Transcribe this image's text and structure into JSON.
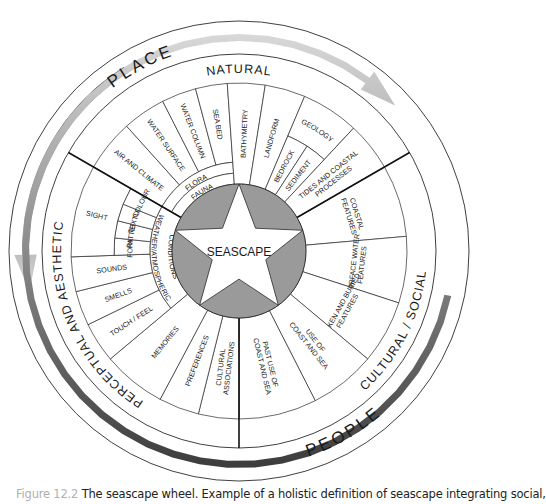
{
  "geometry": {
    "cx": 239,
    "cy": 251,
    "r_outer": 230,
    "r_ring": 197,
    "r_sector": 168,
    "r_mid": 125,
    "r_inner2": 89,
    "r_inner1": 78,
    "r_core": 67
  },
  "colors": {
    "line": "#2a2a2a",
    "core": "#9a9a9a",
    "star": "#ffffff",
    "arrow_dark": "#3c3c3c",
    "arrow_light": "#d4d4d4"
  },
  "center_label": "SEASCAPE",
  "outer_labels": {
    "place": "PLACE",
    "people": "PEOPLE",
    "natural": "NATURAL",
    "cultural_social": "CULTURAL / SOCIAL",
    "perceptual_aesthetic": "PERCEPTUAL AND AESTHETIC"
  },
  "sectors": {
    "natural": [
      {
        "label": [
          "AIR AND CLIMATE"
        ],
        "a0": 210,
        "a1": 228,
        "r0": 89,
        "r1": 168
      },
      {
        "label": [
          "WATER SURFACE"
        ],
        "a0": 228,
        "a1": 243,
        "r0": 89,
        "r1": 168
      },
      {
        "label": [
          "WATER COLUMN"
        ],
        "a0": 243,
        "a1": 255,
        "r0": 89,
        "r1": 168
      },
      {
        "label": [
          "SEA BED"
        ],
        "a0": 255,
        "a1": 266,
        "r0": 89,
        "r1": 168
      },
      {
        "label": [
          "FLORA"
        ],
        "a0": 210,
        "a1": 266,
        "r0": 78,
        "r1": 89,
        "ring": true
      },
      {
        "label": [
          "FAUNA"
        ],
        "a0": 210,
        "a1": 266,
        "r0": 67,
        "r1": 78,
        "ring": true
      },
      {
        "label": [
          "BATHYMETRY"
        ],
        "a0": 266,
        "a1": 279,
        "r0": 67,
        "r1": 168
      },
      {
        "label": [
          "LANDFORM"
        ],
        "a0": 279,
        "a1": 293,
        "r0": 67,
        "r1": 168
      },
      {
        "label": [
          "GEOLOGY"
        ],
        "a0": 293,
        "a1": 313,
        "r0": 125,
        "r1": 168,
        "ring": true
      },
      {
        "label": [
          "BEDROCK"
        ],
        "a0": 293,
        "a1": 303,
        "r0": 67,
        "r1": 125
      },
      {
        "label": [
          "SEDIMENT"
        ],
        "a0": 303,
        "a1": 313,
        "r0": 67,
        "r1": 125
      },
      {
        "label": [
          "TIDES AND COASTAL",
          "PROCESSES"
        ],
        "a0": 313,
        "a1": 330,
        "r0": 67,
        "r1": 168
      }
    ],
    "cultural": [
      {
        "label": [
          "COASTAL",
          "FEATURES"
        ],
        "a0": 330,
        "a1": 355,
        "r0": 67,
        "r1": 168,
        "horiz": true
      },
      {
        "label": [
          "SURFACE WATER",
          "FEATURES"
        ],
        "a0": 355,
        "a1": 378,
        "r0": 67,
        "r1": 168,
        "horiz": true
      },
      {
        "label": [
          "SUNKEN AND BURIED",
          "FEATURES"
        ],
        "a0": 378,
        "a1": 400,
        "r0": 67,
        "r1": 168,
        "horiz": true
      },
      {
        "label": [
          "USE OF",
          "COAST AND SEA"
        ],
        "a0": 400,
        "a1": 423,
        "r0": 67,
        "r1": 168
      },
      {
        "label": [
          "PAST USE OF",
          "COAST AND SEA"
        ],
        "a0": 423,
        "a1": 450,
        "r0": 67,
        "r1": 168
      }
    ],
    "perceptual": [
      {
        "label": [
          "CULTURAL",
          "ASSOCIATIONS"
        ],
        "a0": 90,
        "a1": 104,
        "r0": 67,
        "r1": 168
      },
      {
        "label": [
          "PREFERENCES"
        ],
        "a0": 104,
        "a1": 118,
        "r0": 67,
        "r1": 168
      },
      {
        "label": [
          "MEMORIES"
        ],
        "a0": 118,
        "a1": 140,
        "r0": 67,
        "r1": 168
      },
      {
        "label": [
          "TOUCH / FEEL"
        ],
        "a0": 140,
        "a1": 154,
        "r0": 89,
        "r1": 168
      },
      {
        "label": [
          "SMELLS"
        ],
        "a0": 154,
        "a1": 166,
        "r0": 89,
        "r1": 168
      },
      {
        "label": [
          "SOUNDS"
        ],
        "a0": 166,
        "a1": 178,
        "r0": 89,
        "r1": 168
      },
      {
        "label": [
          "FORM"
        ],
        "a0": 178,
        "a1": 186,
        "r0": 89,
        "r1": 125,
        "horiz": true
      },
      {
        "label": [
          "PATTERN"
        ],
        "a0": 186,
        "a1": 194,
        "r0": 89,
        "r1": 125,
        "horiz": true
      },
      {
        "label": [
          "TEXTURE"
        ],
        "a0": 194,
        "a1": 202,
        "r0": 89,
        "r1": 125,
        "horiz": true
      },
      {
        "label": [
          "COLOUR"
        ],
        "a0": 202,
        "a1": 210,
        "r0": 89,
        "r1": 125,
        "horiz": true
      },
      {
        "label": [
          "SIGHT"
        ],
        "a0": 178,
        "a1": 210,
        "r0": 125,
        "r1": 168
      },
      {
        "label": [
          "WEATHER/ATMOSPHERIC",
          "CONDITIONS"
        ],
        "a0": 140,
        "a1": 210,
        "r0": 67,
        "r1": 89,
        "ring": true
      }
    ]
  },
  "dividers": [
    210,
    330,
    90
  ],
  "arrows": {
    "left": {
      "from": 238,
      "to": 169
    },
    "right": {
      "from": 12,
      "to": 317
    }
  },
  "caption": {
    "figure": "Figure 12.2",
    "text": "The seascape wheel. Example of a holistic definition of seascape integrating social,"
  }
}
